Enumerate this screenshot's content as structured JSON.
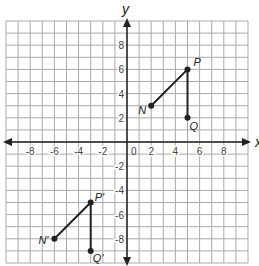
{
  "diagram": {
    "type": "coordinate-grid-reflection",
    "axes": {
      "x_label": "x",
      "y_label": "y",
      "min": -10,
      "max": 10,
      "origin_label": "0"
    },
    "x_ticks": [
      "-8",
      "-6",
      "-4",
      "-2",
      "2",
      "4",
      "6",
      "8"
    ],
    "y_ticks": [
      "8",
      "6",
      "4",
      "2",
      "-2",
      "-4",
      "-6",
      "-8"
    ],
    "points": [
      {
        "label": "P",
        "x": 5,
        "y": 6
      },
      {
        "label": "N",
        "x": 2,
        "y": 3
      },
      {
        "label": "Q",
        "x": 5,
        "y": 2
      },
      {
        "label": "P'",
        "x": -3,
        "y": -5
      },
      {
        "label": "N'",
        "x": -6,
        "y": -8
      },
      {
        "label": "Q'",
        "x": -3,
        "y": -9
      }
    ],
    "segments": [
      [
        "N",
        "P"
      ],
      [
        "P",
        "Q"
      ],
      [
        "N'",
        "P'"
      ],
      [
        "P'",
        "Q'"
      ]
    ]
  }
}
